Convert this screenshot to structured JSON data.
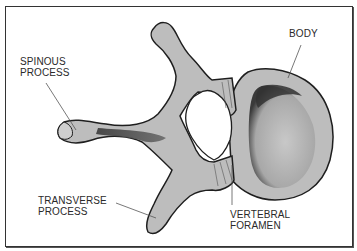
{
  "diagram": {
    "colors": {
      "bone_fill": "#bdbdbd",
      "bone_outline": "#1e1e1e",
      "shadow": "#3a3a3a",
      "leader_line": "#555555",
      "frame": "#333333"
    },
    "labels": [
      {
        "id": "body",
        "line1": "BODY",
        "line2": ""
      },
      {
        "id": "spinous",
        "line1": "SPINOUS",
        "line2": "PROCESS"
      },
      {
        "id": "transverse",
        "line1": "TRANSVERSE",
        "line2": "PROCESS"
      },
      {
        "id": "foramen",
        "line1": "VERTEBRAL",
        "line2": "FORAMEN"
      }
    ]
  }
}
